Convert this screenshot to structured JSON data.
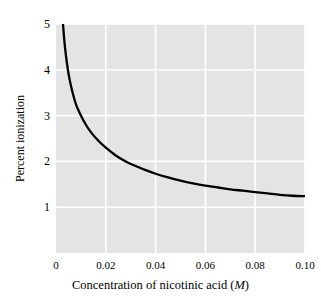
{
  "chart_data": {
    "type": "line",
    "title": "",
    "subtitle": "",
    "xlabel": "Concentration of nicotinic acid (M)",
    "xlabel_text": "Concentration of nicotinic acid (",
    "xlabel_unit": "M",
    "xlabel_close": ")",
    "ylabel": "Percent ionization",
    "xlim": [
      0,
      0.1
    ],
    "ylim": [
      0,
      5
    ],
    "grid": true,
    "legend": false,
    "legend_position": "none",
    "plot_background": "#e4e4e4",
    "gridline_color": "#ffffff",
    "curve_color": "#000000",
    "xticks": [
      "0",
      "0.02",
      "0.04",
      "0.06",
      "0.08",
      "0.10"
    ],
    "xtick_values": [
      0,
      0.02,
      0.04,
      0.06,
      0.08,
      0.1
    ],
    "yticks": [
      "1",
      "2",
      "3",
      "4",
      "5"
    ],
    "ytick_values": [
      1,
      2,
      3,
      4,
      5
    ],
    "series": [
      {
        "name": "Percent ionization of nicotinic acid",
        "x": [
          0.0028,
          0.0035,
          0.0045,
          0.0055,
          0.0065,
          0.008,
          0.01,
          0.012,
          0.014,
          0.017,
          0.02,
          0.024,
          0.028,
          0.032,
          0.036,
          0.04,
          0.045,
          0.05,
          0.055,
          0.06,
          0.065,
          0.07,
          0.075,
          0.08,
          0.085,
          0.09,
          0.095,
          0.1
        ],
        "y": [
          5.0,
          4.55,
          4.1,
          3.78,
          3.54,
          3.25,
          3.0,
          2.8,
          2.64,
          2.45,
          2.3,
          2.13,
          2.0,
          1.9,
          1.81,
          1.73,
          1.65,
          1.58,
          1.52,
          1.47,
          1.43,
          1.39,
          1.36,
          1.33,
          1.3,
          1.27,
          1.25,
          1.24
        ]
      }
    ],
    "annotations": []
  }
}
